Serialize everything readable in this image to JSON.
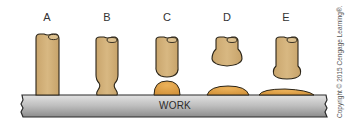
{
  "diagram": {
    "stages": [
      {
        "label": "A",
        "description": "electrode touching work, solid"
      },
      {
        "label": "B",
        "description": "electrode tip necking near work"
      },
      {
        "label": "C",
        "description": "molten drop separating onto work"
      },
      {
        "label": "D",
        "description": "electrode retracted, puddle spreading"
      },
      {
        "label": "E",
        "description": "electrode retracted, flat weld bead"
      }
    ],
    "work_label": "WORK",
    "copyright": "Copyright © 2015 Cengage Learning®.",
    "colors": {
      "electrode": "#d2b07a",
      "electrode_outline": "#2a2418",
      "molten": "#e0a248",
      "work_light": "#d8d8d8",
      "work_dark": "#8a8a8a",
      "outline": "#222222"
    }
  }
}
